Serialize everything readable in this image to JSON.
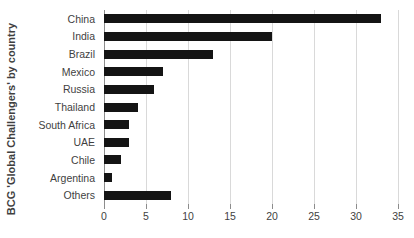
{
  "chart_data": {
    "type": "bar",
    "orientation": "horizontal",
    "title": "",
    "xlabel": "",
    "ylabel": "BCG 'Global Challengers' by country",
    "categories": [
      "China",
      "India",
      "Brazil",
      "Mexico",
      "Russia",
      "Thailand",
      "South Africa",
      "UAE",
      "Chile",
      "Argentina",
      "Others"
    ],
    "values": [
      33,
      20,
      13,
      7,
      6,
      4,
      3,
      3,
      2,
      1,
      8
    ],
    "xlim": [
      0,
      35
    ],
    "xticks": [
      0,
      5,
      10,
      15,
      20,
      25,
      30,
      35
    ],
    "xtick_labels": [
      "0",
      "5",
      "10",
      "15",
      "20",
      "25",
      "30",
      "35"
    ],
    "grid": "vertical",
    "legend": "none",
    "bar_color": "#141414",
    "gridline_color": "#d9d9d9",
    "axis_color": "#8c8c8c",
    "text_color": "#3f3f3f",
    "background": "#ffffff"
  }
}
